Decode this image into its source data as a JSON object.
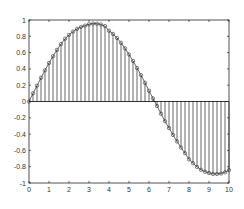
{
  "chart_data": {
    "type": "stem",
    "title": "",
    "xlabel": "",
    "ylabel": "",
    "xlim": [
      0,
      10
    ],
    "ylim": [
      -1,
      1
    ],
    "grid": false,
    "legend": null,
    "xticks": [
      0,
      1,
      2,
      3,
      4,
      5,
      6,
      7,
      8,
      9,
      10
    ],
    "xtick_labels": [
      "0",
      "1",
      "2",
      "3",
      "4",
      "5",
      "6",
      "7",
      "8",
      "9",
      "10"
    ],
    "yticks": [
      -1,
      -0.8,
      -0.6,
      -0.4,
      -0.2,
      0,
      0.2,
      0.4,
      0.6,
      0.8,
      1
    ],
    "ytick_labels": [
      "-1",
      "-0.8",
      "-0.6",
      "-0.4",
      "-0.2",
      "0",
      "0.2",
      "0.4",
      "0.6",
      "0.8",
      "1"
    ],
    "marker": "circle-open",
    "line_color": "#000000",
    "stem_color": "#000000",
    "baseline": 0,
    "series": [
      {
        "name": "stem",
        "x": [
          0,
          0.2,
          0.4,
          0.6,
          0.8,
          1,
          1.2,
          1.4,
          1.6,
          1.8,
          2,
          2.2,
          2.4,
          2.6,
          2.8,
          3,
          3.2,
          3.4,
          3.6,
          3.8,
          4,
          4.2,
          4.4,
          4.6,
          4.8,
          5,
          5.2,
          5.4,
          5.6,
          5.8,
          6,
          6.2,
          6.4,
          6.6,
          6.8,
          7,
          7.2,
          7.4,
          7.6,
          7.8,
          8,
          8.2,
          8.4,
          8.6,
          8.8,
          9,
          9.2,
          9.4,
          9.6,
          9.8,
          10
        ],
        "values": [
          0,
          0.1,
          0.194,
          0.291,
          0.383,
          0.473,
          0.556,
          0.634,
          0.705,
          0.77,
          0.817,
          0.858,
          0.891,
          0.915,
          0.931,
          0.948,
          0.957,
          0.955,
          0.945,
          0.925,
          0.868,
          0.829,
          0.78,
          0.72,
          0.652,
          0.578,
          0.497,
          0.412,
          0.323,
          0.23,
          0.131,
          0.038,
          -0.055,
          -0.15,
          -0.242,
          -0.326,
          -0.41,
          -0.49,
          -0.566,
          -0.634,
          -0.71,
          -0.757,
          -0.802,
          -0.838,
          -0.862,
          -0.878,
          -0.889,
          -0.889,
          -0.884,
          -0.868,
          -0.843
        ]
      }
    ]
  }
}
